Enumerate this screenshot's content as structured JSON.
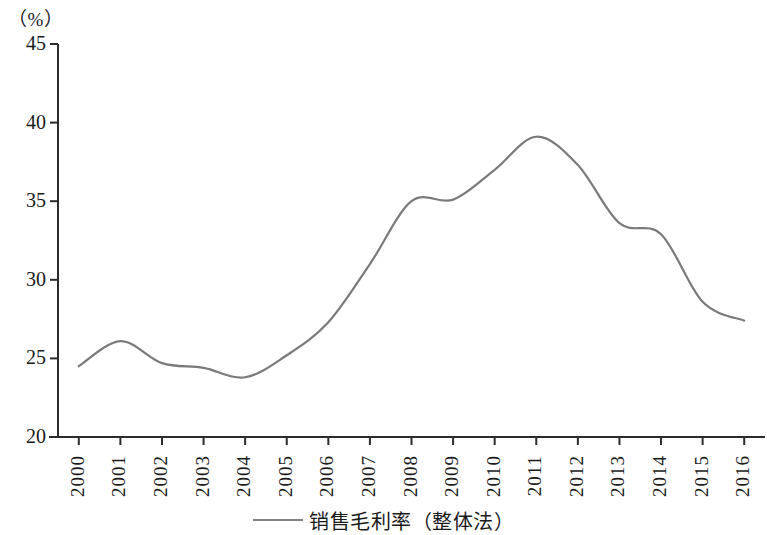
{
  "chart_data": {
    "type": "line",
    "title": "",
    "subtitle": "",
    "xlabel": "",
    "ylabel": "（%）",
    "unit_label": "（%）",
    "categories": [
      "2000",
      "2001",
      "2002",
      "2003",
      "2004",
      "2005",
      "2006",
      "2007",
      "2008",
      "2009",
      "2010",
      "2011",
      "2012",
      "2013",
      "2014",
      "2015",
      "2016"
    ],
    "series": [
      {
        "name": "销售毛利率（整体法）",
        "color": "#7a7a7a",
        "values": [
          24.5,
          26.1,
          24.7,
          24.4,
          23.8,
          25.2,
          27.3,
          31.0,
          35.0,
          35.1,
          37.0,
          39.1,
          37.3,
          33.6,
          32.9,
          28.6,
          27.4
        ]
      }
    ],
    "ylim": [
      20,
      45
    ],
    "yticks": [
      20,
      25,
      30,
      35,
      40,
      45
    ],
    "ytick_labels": [
      "20",
      "25",
      "30",
      "35",
      "40",
      "45"
    ],
    "xtick_labels": [
      "2000",
      "2001",
      "2002",
      "2003",
      "2004",
      "2005",
      "2006",
      "2007",
      "2008",
      "2009",
      "2010",
      "2011",
      "2012",
      "2013",
      "2014",
      "2015",
      "2016"
    ],
    "grid": false,
    "legend_position": "bottom",
    "legend": [
      {
        "label": "销售毛利率（整体法）",
        "color": "#7a7a7a",
        "marker": "line"
      }
    ],
    "axis_color": "#2b2b2b"
  }
}
